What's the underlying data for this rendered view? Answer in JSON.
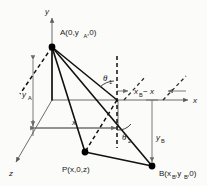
{
  "figure": {
    "background_color": "#fbfbf9",
    "line_color": "#111111",
    "axis_color": "#5b5b5b"
  },
  "axes": [
    {
      "id": "y-axis",
      "label": "y",
      "direction": "up"
    },
    {
      "id": "x-axis",
      "label": "x",
      "direction": "right"
    },
    {
      "id": "z-axis",
      "label": "z",
      "direction": "down-left"
    }
  ],
  "points": [
    {
      "id": "point-a",
      "label": "A(0,y",
      "sub": "A",
      "label_tail": ",0)",
      "x": 52,
      "y": 47
    },
    {
      "id": "point-p",
      "label": "P(x,0,z)",
      "x": 85,
      "y": 152
    },
    {
      "id": "point-b",
      "label": "B(x",
      "sub": "B",
      "label_mid": ",y",
      "sub2": "B",
      "label_tail": ",0)",
      "x": 152,
      "y": 166
    }
  ],
  "labels": {
    "y_axis": "y",
    "x_axis": "x",
    "z_axis": "z",
    "point_a_text": "A(0,y",
    "point_a_sub": "A",
    "point_a_tail": ",0)",
    "point_p_text": "P(x,0,z)",
    "point_b_text": "B(x",
    "point_b_sub1": "B",
    "point_b_mid": ",y",
    "point_b_sub2": "B",
    "point_b_tail": ",0)",
    "y_a_text": "y",
    "y_a_sub": "A",
    "y_b_text": "y",
    "y_b_sub": "B",
    "x_dim_text": "x",
    "xb_minus_x_text": "x",
    "xb_minus_x_sub": "B",
    "xb_minus_x_tail": "− x",
    "theta1_text": "θ",
    "theta1_sub": "1",
    "theta2_text": "θ",
    "theta2_sub": "2"
  }
}
